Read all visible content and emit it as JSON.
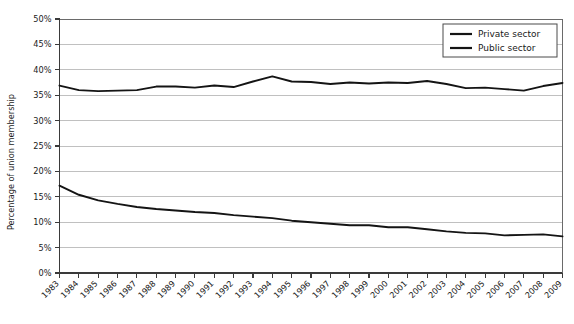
{
  "chart_data": {
    "type": "line",
    "title": "",
    "xlabel": "",
    "ylabel": "Percentage of union membership",
    "ylim": [
      0,
      50
    ],
    "ytick_labels": [
      "0%",
      "5%",
      "10%",
      "15%",
      "20%",
      "25%",
      "30%",
      "35%",
      "40%",
      "45%",
      "50%"
    ],
    "ytick_values": [
      0,
      5,
      10,
      15,
      20,
      25,
      30,
      35,
      40,
      45,
      50
    ],
    "grid": "horizontal",
    "legend_position": "top-right",
    "categories": [
      "1983",
      "1984",
      "1985",
      "1986",
      "1987",
      "1988",
      "1989",
      "1990",
      "1991",
      "1992",
      "1993",
      "1994",
      "1995",
      "1996",
      "1997",
      "1998",
      "1999",
      "2000",
      "2001",
      "2002",
      "2003",
      "2004",
      "2005",
      "2006",
      "2007",
      "2008",
      "2009"
    ],
    "series": [
      {
        "name": "Private sector",
        "values": [
          17.2,
          15.4,
          14.3,
          13.6,
          13.0,
          12.6,
          12.3,
          12.0,
          11.8,
          11.4,
          11.1,
          10.8,
          10.3,
          10.0,
          9.7,
          9.4,
          9.4,
          9.0,
          9.0,
          8.6,
          8.2,
          7.9,
          7.8,
          7.4,
          7.5,
          7.6,
          7.2
        ]
      },
      {
        "name": "Public sector",
        "values": [
          36.9,
          36.0,
          35.8,
          35.9,
          36.0,
          36.7,
          36.7,
          36.5,
          36.9,
          36.6,
          37.7,
          38.7,
          37.7,
          37.6,
          37.2,
          37.5,
          37.3,
          37.5,
          37.4,
          37.8,
          37.2,
          36.4,
          36.5,
          36.2,
          35.9,
          36.8,
          37.4
        ]
      }
    ]
  },
  "legend": {
    "entries": [
      {
        "label": "Private sector"
      },
      {
        "label": "Public sector"
      }
    ]
  }
}
